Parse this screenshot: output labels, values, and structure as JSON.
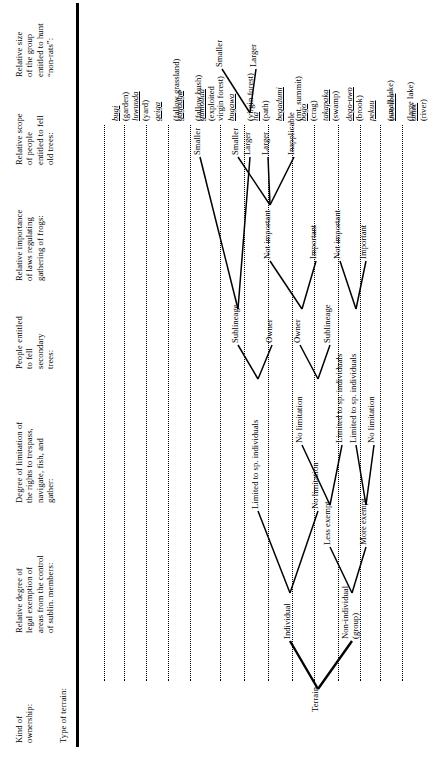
{
  "figure": {
    "orientation": "rotated-90-ccw",
    "columns": [
      {
        "id": "ownership",
        "title": "Kind of\nownership:"
      },
      {
        "id": "exemption",
        "title": "Relative degree of\nlegal exemption of\nareas from the control\nof sublin. members:"
      },
      {
        "id": "limitation",
        "title": "Degree of limitation of\nthe rights to trespass,\nnavigate, fish, and\ngather:"
      },
      {
        "id": "secondary",
        "title": "People entitled\nto fell\nsecondary\ntrees:"
      },
      {
        "id": "frogs",
        "title": "Relative importance\nof laws regulating\ngathering of frogs:"
      },
      {
        "id": "oldtrees",
        "title": "Relative scope\nof people\nentitled to fell\nold trees:"
      },
      {
        "id": "nonrats",
        "title": "Relative size\nof the group\nentitled to hunt\n“non-rats”:"
      },
      {
        "id": "terrain",
        "title": "Type of terrain:"
      }
    ],
    "root": {
      "id": "terrain-root",
      "label": "Terrain"
    },
    "ownership": [
      {
        "id": "own-individual",
        "label": "Individual"
      },
      {
        "id": "own-group",
        "label": "Non-individual\n(group)"
      }
    ],
    "exemption": [
      {
        "id": "ex-less",
        "label": "Less exempt"
      },
      {
        "id": "ex-more",
        "label": "More exempt"
      }
    ],
    "limitation": [
      {
        "id": "lim-1",
        "label": "Limited to sp. individuals"
      },
      {
        "id": "lim-2",
        "label": "No limitation"
      },
      {
        "id": "lim-3",
        "label": "No limitation"
      },
      {
        "id": "lim-4",
        "label": "Limited to sp. individuals"
      },
      {
        "id": "lim-5",
        "label": "Limited to sp. individuals"
      },
      {
        "id": "lim-6",
        "label": "No limitation"
      }
    ],
    "secondary": [
      {
        "id": "sec-1",
        "label": "Sublineage"
      },
      {
        "id": "sec-2",
        "label": "Owner"
      },
      {
        "id": "sec-3",
        "label": "Owner"
      },
      {
        "id": "sec-4",
        "label": "Sublineage"
      }
    ],
    "frogs": [
      {
        "id": "frog-1",
        "label": "Not important"
      },
      {
        "id": "frog-2",
        "label": "Important"
      },
      {
        "id": "frog-3",
        "label": "Not important"
      },
      {
        "id": "frog-4",
        "label": "Important"
      }
    ],
    "oldtrees": [
      {
        "id": "old-1",
        "label": "Smaller"
      },
      {
        "id": "old-2",
        "label": "Larger"
      },
      {
        "id": "old-3",
        "label": "Smaller"
      },
      {
        "id": "old-4",
        "label": "Larger"
      },
      {
        "id": "old-5",
        "label": "Inapplicable"
      }
    ],
    "nonrats": [
      {
        "id": "rat-1",
        "label": "Smaller"
      },
      {
        "id": "rat-2",
        "label": "Larger"
      }
    ],
    "terrains": [
      {
        "id": "t-bugi",
        "native": "bugi",
        "gloss": "(garden)"
      },
      {
        "id": "t-luwuuda",
        "native": "luwuuda",
        "gloss": "(yard)"
      },
      {
        "id": "t-geiga",
        "native": "geiga",
        "gloss": "(fallow grassland)"
      },
      {
        "id": "t-gagaaga",
        "native": "gagaaga",
        "gloss": "(fallow bush)"
      },
      {
        "id": "t-gumouda",
        "native": "gumouda",
        "gloss": "(exploited\nvirgin forest)"
      },
      {
        "id": "t-bugawa",
        "native": "bugawa",
        "gloss": "(virgin forest)"
      },
      {
        "id": "t-ita",
        "native": "ita",
        "gloss": "(path)"
      },
      {
        "id": "t-begadumi",
        "native": "begadumi",
        "gloss": "(mt. summit)"
      },
      {
        "id": "t-bogo",
        "native": "bogo",
        "gloss": "(crag)"
      },
      {
        "id": "t-takapaka",
        "native": "takapaka",
        "gloss": "(swamp)"
      },
      {
        "id": "t-degouwo",
        "native": "dego-uwo",
        "gloss": "(brook)"
      },
      {
        "id": "t-pekuu",
        "native": "pekuu",
        "gloss": "(small lake)"
      },
      {
        "id": "t-uwoibo",
        "native": "uwo ibo",
        "gloss": "(large lake)"
      },
      {
        "id": "t-omee",
        "native": "omee",
        "gloss": "(river)"
      }
    ]
  }
}
